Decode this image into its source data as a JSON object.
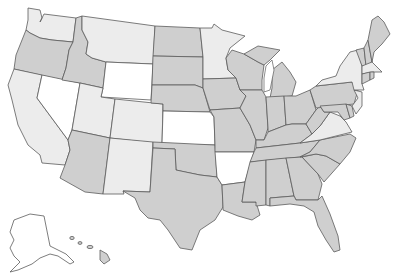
{
  "map": {
    "title": "United States map with states shaded in three tones",
    "legend_tones": {
      "white": "#ffffff",
      "light": "#ececec",
      "medium": "#cfcfcf"
    },
    "border_color": "#5c5c5c",
    "states": {
      "WA": {
        "name": "Washington",
        "tone": "light"
      },
      "OR": {
        "name": "Oregon",
        "tone": "medium"
      },
      "CA": {
        "name": "California",
        "tone": "light"
      },
      "NV": {
        "name": "Nevada",
        "tone": "white"
      },
      "ID": {
        "name": "Idaho",
        "tone": "medium"
      },
      "MT": {
        "name": "Montana",
        "tone": "light"
      },
      "WY": {
        "name": "Wyoming",
        "tone": "white"
      },
      "UT": {
        "name": "Utah",
        "tone": "light"
      },
      "CO": {
        "name": "Colorado",
        "tone": "light"
      },
      "AZ": {
        "name": "Arizona",
        "tone": "medium"
      },
      "NM": {
        "name": "New Mexico",
        "tone": "light"
      },
      "ND": {
        "name": "North Dakota",
        "tone": "medium"
      },
      "SD": {
        "name": "South Dakota",
        "tone": "medium"
      },
      "NE": {
        "name": "Nebraska",
        "tone": "medium"
      },
      "KS": {
        "name": "Kansas",
        "tone": "white"
      },
      "OK": {
        "name": "Oklahoma",
        "tone": "medium"
      },
      "TX": {
        "name": "Texas",
        "tone": "medium"
      },
      "MN": {
        "name": "Minnesota",
        "tone": "light"
      },
      "IA": {
        "name": "Iowa",
        "tone": "medium"
      },
      "MO": {
        "name": "Missouri",
        "tone": "medium"
      },
      "AR": {
        "name": "Arkansas",
        "tone": "white"
      },
      "LA": {
        "name": "Louisiana",
        "tone": "medium"
      },
      "WI": {
        "name": "Wisconsin",
        "tone": "medium"
      },
      "IL": {
        "name": "Illinois",
        "tone": "medium"
      },
      "MI": {
        "name": "Michigan",
        "tone": "medium"
      },
      "IN": {
        "name": "Indiana",
        "tone": "medium"
      },
      "OH": {
        "name": "Ohio",
        "tone": "medium"
      },
      "KY": {
        "name": "Kentucky",
        "tone": "medium"
      },
      "TN": {
        "name": "Tennessee",
        "tone": "medium"
      },
      "MS": {
        "name": "Mississippi",
        "tone": "medium"
      },
      "AL": {
        "name": "Alabama",
        "tone": "medium"
      },
      "GA": {
        "name": "Georgia",
        "tone": "medium"
      },
      "FL": {
        "name": "Florida",
        "tone": "medium"
      },
      "SC": {
        "name": "South Carolina",
        "tone": "medium"
      },
      "NC": {
        "name": "North Carolina",
        "tone": "medium"
      },
      "VA": {
        "name": "Virginia",
        "tone": "light"
      },
      "WV": {
        "name": "West Virginia",
        "tone": "medium"
      },
      "PA": {
        "name": "Pennsylvania",
        "tone": "medium"
      },
      "NY": {
        "name": "New York",
        "tone": "light"
      },
      "NJ": {
        "name": "New Jersey",
        "tone": "light"
      },
      "MD": {
        "name": "Maryland",
        "tone": "medium"
      },
      "DE": {
        "name": "Delaware",
        "tone": "medium"
      },
      "VT": {
        "name": "Vermont",
        "tone": "medium"
      },
      "NH": {
        "name": "New Hampshire",
        "tone": "medium"
      },
      "ME": {
        "name": "Maine",
        "tone": "medium"
      },
      "MA": {
        "name": "Massachusetts",
        "tone": "light"
      },
      "CT": {
        "name": "Connecticut",
        "tone": "medium"
      },
      "RI": {
        "name": "Rhode Island",
        "tone": "medium"
      },
      "AK": {
        "name": "Alaska",
        "tone": "white"
      },
      "HI": {
        "name": "Hawaii",
        "tone": "medium"
      }
    }
  }
}
